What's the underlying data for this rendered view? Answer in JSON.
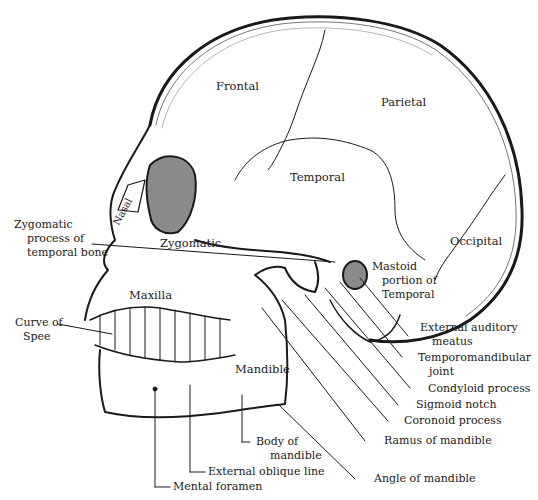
{
  "bone_labels": {
    "frontal": "Frontal",
    "parietal": "Parietal",
    "temporal": "Temporal",
    "occipital": "Occipital",
    "nasal": "Nasal",
    "zygomatic": "Zygomatic",
    "maxilla": "Maxilla",
    "mandible": "Mandible",
    "mastoid_line1": "Mastoid",
    "mastoid_line2": "portion of",
    "mastoid_line3": "Temporal"
  },
  "callouts": {
    "zygomatic_process": [
      "Zygomatic",
      "process of",
      "temporal bone"
    ],
    "curve_of_spee": [
      "Curve of",
      "Spee"
    ],
    "external_auditory_meatus": [
      "External auditory",
      "meatus"
    ],
    "temporomandibular_joint": [
      "Temporomandibular",
      "joint"
    ],
    "condyloid_process": "Condyloid process",
    "sigmoid_notch": "Sigmoid notch",
    "coronoid_process": "Coronoid process",
    "ramus_of_mandible": "Ramus of mandible",
    "angle_of_mandible": "Angle of mandible",
    "body_of_mandible": [
      "Body of",
      "mandible"
    ],
    "external_oblique_line": "External oblique line",
    "mental_foramen": "Mental foramen"
  },
  "colors": {
    "ink": "#1a1a1a",
    "background": "#ffffff"
  }
}
